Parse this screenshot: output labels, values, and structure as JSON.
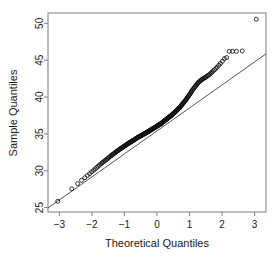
{
  "chart_data": {
    "type": "scatter",
    "title": "",
    "subtitle": "",
    "xlabel": "Theoretical Quantiles",
    "ylabel": "Sample Quantiles",
    "xlim": [
      -3.35,
      3.35
    ],
    "ylim": [
      24.4,
      51.4
    ],
    "xticks": [
      -3,
      -2,
      -1,
      0,
      1,
      2,
      3
    ],
    "xtick_labels": [
      "−3",
      "−2",
      "−1",
      "0",
      "1",
      "2",
      "3"
    ],
    "yticks": [
      25,
      30,
      35,
      40,
      45,
      50
    ],
    "ytick_labels": [
      "25",
      "30",
      "35",
      "40",
      "45",
      "50"
    ],
    "grid": false,
    "legend": "none",
    "frame": true,
    "marker": "open-circle",
    "marker_size": 2.0,
    "point_color": "#101010",
    "line_color": "#555555",
    "axis_color": "#888888",
    "background": "#ffffff",
    "reference_line": {
      "name": "qqline",
      "slope": 3.12,
      "intercept": 35.4,
      "x_start": -3.35,
      "y_start": 24.95,
      "x_end": 3.35,
      "y_end": 45.85
    },
    "series": [
      {
        "name": "sample quantiles",
        "x": [
          -3.05,
          -2.62,
          -2.44,
          -2.32,
          -2.22,
          -2.14,
          -2.07,
          -2.01,
          -1.95,
          -1.9,
          -1.85,
          -1.81,
          -1.77,
          -1.73,
          -1.69,
          -1.66,
          -1.62,
          -1.59,
          -1.56,
          -1.53,
          -1.5,
          -1.48,
          -1.45,
          -1.42,
          -1.4,
          -1.37,
          -1.35,
          -1.33,
          -1.3,
          -1.28,
          -1.26,
          -1.24,
          -1.22,
          -1.2,
          -1.18,
          -1.16,
          -1.14,
          -1.12,
          -1.1,
          -1.08,
          -1.06,
          -1.05,
          -1.03,
          -1.01,
          -0.99,
          -0.98,
          -0.96,
          -0.94,
          -0.93,
          -0.91,
          -0.9,
          -0.88,
          -0.87,
          -0.85,
          -0.84,
          -0.82,
          -0.81,
          -0.79,
          -0.78,
          -0.76,
          -0.75,
          -0.74,
          -0.72,
          -0.71,
          -0.69,
          -0.68,
          -0.67,
          -0.65,
          -0.64,
          -0.63,
          -0.61,
          -0.6,
          -0.59,
          -0.58,
          -0.56,
          -0.55,
          -0.54,
          -0.53,
          -0.51,
          -0.5,
          -0.49,
          -0.48,
          -0.46,
          -0.45,
          -0.44,
          -0.43,
          -0.42,
          -0.4,
          -0.39,
          -0.38,
          -0.37,
          -0.36,
          -0.35,
          -0.33,
          -0.32,
          -0.31,
          -0.3,
          -0.29,
          -0.28,
          -0.27,
          -0.25,
          -0.24,
          -0.23,
          -0.22,
          -0.21,
          -0.2,
          -0.19,
          -0.18,
          -0.16,
          -0.15,
          -0.14,
          -0.13,
          -0.12,
          -0.11,
          -0.1,
          -0.09,
          -0.08,
          -0.06,
          -0.05,
          -0.04,
          -0.03,
          -0.02,
          -0.01,
          0.0,
          0.01,
          0.02,
          0.03,
          0.04,
          0.05,
          0.06,
          0.08,
          0.09,
          0.1,
          0.11,
          0.12,
          0.13,
          0.14,
          0.15,
          0.16,
          0.18,
          0.19,
          0.2,
          0.21,
          0.22,
          0.23,
          0.24,
          0.25,
          0.27,
          0.28,
          0.29,
          0.3,
          0.31,
          0.32,
          0.33,
          0.35,
          0.36,
          0.37,
          0.38,
          0.39,
          0.4,
          0.42,
          0.43,
          0.44,
          0.45,
          0.46,
          0.48,
          0.49,
          0.5,
          0.51,
          0.53,
          0.54,
          0.55,
          0.56,
          0.58,
          0.59,
          0.6,
          0.61,
          0.63,
          0.64,
          0.65,
          0.67,
          0.68,
          0.69,
          0.71,
          0.72,
          0.74,
          0.75,
          0.76,
          0.78,
          0.79,
          0.81,
          0.82,
          0.84,
          0.85,
          0.87,
          0.88,
          0.9,
          0.91,
          0.93,
          0.94,
          0.96,
          0.98,
          0.99,
          1.01,
          1.03,
          1.05,
          1.06,
          1.08,
          1.1,
          1.12,
          1.14,
          1.16,
          1.18,
          1.2,
          1.22,
          1.24,
          1.26,
          1.28,
          1.3,
          1.33,
          1.35,
          1.37,
          1.4,
          1.42,
          1.45,
          1.48,
          1.5,
          1.53,
          1.56,
          1.59,
          1.62,
          1.66,
          1.69,
          1.73,
          1.77,
          1.81,
          1.85,
          1.9,
          1.95,
          2.01,
          2.07,
          2.14,
          2.22,
          2.32,
          2.44,
          2.62,
          3.05
        ],
        "y": [
          25.85,
          27.55,
          28.25,
          28.7,
          29.05,
          29.35,
          29.6,
          29.85,
          30.05,
          30.25,
          30.45,
          30.6,
          30.75,
          30.9,
          31.05,
          31.15,
          31.3,
          31.4,
          31.5,
          31.6,
          31.7,
          31.8,
          31.9,
          32.0,
          32.08,
          32.16,
          32.24,
          32.32,
          32.4,
          32.48,
          32.55,
          32.62,
          32.68,
          32.74,
          32.8,
          32.86,
          32.92,
          32.98,
          33.04,
          33.1,
          33.16,
          33.21,
          33.26,
          33.31,
          33.36,
          33.41,
          33.46,
          33.51,
          33.56,
          33.61,
          33.66,
          33.7,
          33.74,
          33.78,
          33.82,
          33.86,
          33.9,
          33.94,
          33.98,
          34.02,
          34.06,
          34.1,
          34.14,
          34.18,
          34.22,
          34.26,
          34.3,
          34.34,
          34.38,
          34.42,
          34.46,
          34.49,
          34.52,
          34.55,
          34.58,
          34.61,
          34.64,
          34.67,
          34.7,
          34.73,
          34.76,
          34.79,
          34.82,
          34.85,
          34.88,
          34.91,
          34.94,
          34.97,
          35.0,
          35.03,
          35.06,
          35.09,
          35.12,
          35.15,
          35.18,
          35.21,
          35.24,
          35.27,
          35.3,
          35.33,
          35.36,
          35.39,
          35.42,
          35.45,
          35.48,
          35.51,
          35.54,
          35.57,
          35.6,
          35.63,
          35.66,
          35.69,
          35.72,
          35.75,
          35.78,
          35.81,
          35.84,
          35.87,
          35.9,
          35.93,
          35.96,
          35.99,
          36.02,
          36.05,
          36.08,
          36.11,
          36.14,
          36.17,
          36.2,
          36.23,
          36.26,
          36.29,
          36.32,
          36.35,
          36.38,
          36.42,
          36.46,
          36.5,
          36.54,
          36.58,
          36.62,
          36.66,
          36.7,
          36.74,
          36.78,
          36.82,
          36.86,
          36.9,
          36.94,
          36.98,
          37.02,
          37.06,
          37.1,
          37.14,
          37.18,
          37.22,
          37.26,
          37.3,
          37.34,
          37.38,
          37.42,
          37.46,
          37.5,
          37.55,
          37.6,
          37.65,
          37.7,
          37.75,
          37.8,
          37.85,
          37.9,
          37.95,
          38.0,
          38.05,
          38.1,
          38.16,
          38.22,
          38.28,
          38.34,
          38.4,
          38.46,
          38.52,
          38.58,
          38.64,
          38.7,
          38.78,
          38.86,
          38.94,
          39.02,
          39.1,
          39.18,
          39.26,
          39.34,
          39.42,
          39.5,
          39.58,
          39.68,
          39.78,
          39.88,
          39.98,
          40.08,
          40.18,
          40.28,
          40.4,
          40.52,
          40.64,
          40.76,
          40.88,
          41.0,
          41.12,
          41.24,
          41.36,
          41.46,
          41.56,
          41.68,
          41.8,
          41.9,
          42.0,
          42.1,
          42.2,
          42.28,
          42.34,
          42.42,
          42.5,
          42.58,
          42.62,
          42.7,
          42.82,
          42.9,
          42.96,
          43.1,
          43.25,
          43.4,
          43.55,
          43.7,
          43.88,
          44.05,
          44.3,
          44.55,
          44.85,
          45.2,
          45.35,
          46.2,
          46.2,
          46.2,
          46.25,
          50.55
        ]
      }
    ],
    "annotations": [
      {
        "text": "upper tail deviates above reference line",
        "x": 2.2,
        "y": 46.0
      }
    ]
  },
  "axes": {
    "x_title": "Theoretical Quantiles",
    "y_title": "Sample Quantiles"
  }
}
